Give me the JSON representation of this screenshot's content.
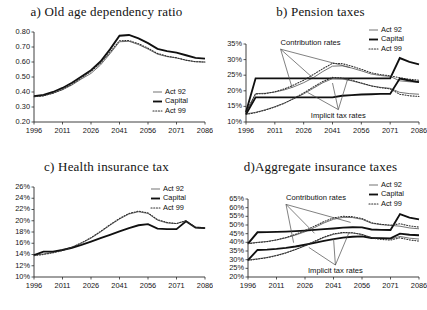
{
  "figure": {
    "legend_labels": [
      "Act 92",
      "Capital",
      "Act 99"
    ],
    "series_styles": [
      "thin-grey-line",
      "thick-black-line",
      "dotted-line"
    ],
    "colors": {
      "act92": "#6d6d6d",
      "capital": "#101010",
      "act99": "#2e2e2e",
      "axis": "#2b2b2b",
      "background": "#ffffff"
    },
    "annotations": {
      "contribution": "Contribution rates",
      "implicit": "Implicit tax rates"
    }
  },
  "chart_data": [
    {
      "panel": "a",
      "type": "line",
      "title": "a) Old age dependency ratio",
      "xlabel": "",
      "ylabel": "",
      "x": [
        1996,
        2001,
        2006,
        2011,
        2016,
        2021,
        2026,
        2031,
        2036,
        2041,
        2046,
        2051,
        2056,
        2061,
        2066,
        2071,
        2076,
        2081,
        2086
      ],
      "xlim": [
        1996,
        2086
      ],
      "ylim": [
        0.2,
        0.8
      ],
      "xticks": [
        1996,
        2011,
        2026,
        2041,
        2056,
        2071,
        2086
      ],
      "yticks": [
        0.2,
        0.3,
        0.4,
        0.5,
        0.6,
        0.7,
        0.8
      ],
      "ytick_labels": [
        "0.20",
        "0.30",
        "0.40",
        "0.50",
        "0.60",
        "0.70",
        "0.80"
      ],
      "grid": false,
      "legend_position": "inside-bottom-right",
      "series": [
        {
          "name": "Act 92",
          "values": [
            0.37,
            0.375,
            0.392,
            0.415,
            0.447,
            0.487,
            0.524,
            0.58,
            0.655,
            0.735,
            0.738,
            0.716,
            0.686,
            0.652,
            0.636,
            0.627,
            0.612,
            0.602,
            0.6
          ]
        },
        {
          "name": "Capital",
          "values": [
            0.372,
            0.381,
            0.4,
            0.427,
            0.462,
            0.503,
            0.545,
            0.603,
            0.684,
            0.775,
            0.78,
            0.757,
            0.726,
            0.688,
            0.672,
            0.662,
            0.645,
            0.628,
            0.622
          ]
        },
        {
          "name": "Act 99",
          "values": [
            0.368,
            0.374,
            0.392,
            0.418,
            0.452,
            0.494,
            0.537,
            0.592,
            0.665,
            0.742,
            0.743,
            0.722,
            0.692,
            0.657,
            0.639,
            0.628,
            0.612,
            0.602,
            0.6
          ]
        }
      ]
    },
    {
      "panel": "b",
      "type": "line",
      "title": "b) Pension taxes",
      "xlabel": "",
      "ylabel": "",
      "x": [
        1996,
        2001,
        2006,
        2011,
        2016,
        2021,
        2026,
        2031,
        2036,
        2041,
        2046,
        2051,
        2056,
        2061,
        2066,
        2071,
        2076,
        2081,
        2086
      ],
      "xlim": [
        1996,
        2086
      ],
      "ylim": [
        10,
        35
      ],
      "xticks": [
        1996,
        2011,
        2026,
        2041,
        2056,
        2071,
        2086
      ],
      "yticks": [
        10,
        15,
        20,
        25,
        30,
        35
      ],
      "ytick_labels": [
        "10%",
        "15%",
        "20%",
        "25%",
        "30%",
        "35%"
      ],
      "grid": false,
      "legend_position": "top-right-outside",
      "annotations": [
        {
          "text": "Contribution rates",
          "x": 2014,
          "y": 34.6
        },
        {
          "text": "Implicit tax rates",
          "x": 2044,
          "y": 11.4
        }
      ],
      "groups": [
        {
          "group": "Contribution rates",
          "series": [
            {
              "name": "Act 92",
              "values": [
                13.3,
                19.1,
                19.2,
                19.6,
                20.3,
                21.3,
                22.6,
                24.2,
                26.2,
                27.9,
                28.0,
                27.3,
                26.4,
                25.4,
                24.9,
                24.6,
                23.2,
                22.9,
                22.7
              ]
            },
            {
              "name": "Capital",
              "values": [
                13.2,
                24.0,
                24.0,
                24.0,
                24.0,
                24.0,
                24.0,
                24.0,
                24.0,
                24.0,
                24.0,
                24.0,
                24.0,
                24.0,
                24.0,
                24.0,
                30.5,
                29.3,
                28.5
              ]
            },
            {
              "name": "Act 99",
              "values": [
                13.1,
                19.0,
                19.1,
                19.7,
                20.6,
                21.9,
                23.4,
                25.2,
                27.1,
                28.8,
                28.7,
                27.9,
                26.9,
                25.8,
                25.2,
                24.8,
                24.2,
                23.7,
                23.4
              ]
            }
          ]
        },
        {
          "group": "Implicit tax rates",
          "series": [
            {
              "name": "Act 92",
              "values": [
                12.6,
                13.1,
                13.9,
                14.9,
                16.1,
                17.5,
                19.0,
                20.8,
                22.6,
                23.9,
                23.8,
                23.2,
                22.4,
                21.6,
                21.1,
                20.8,
                19.5,
                19.1,
                18.9
              ]
            },
            {
              "name": "Capital",
              "values": [
                12.5,
                17.9,
                17.9,
                17.9,
                17.9,
                17.9,
                17.9,
                17.9,
                17.9,
                17.9,
                18.4,
                18.6,
                18.8,
                18.9,
                19.0,
                19.0,
                23.9,
                23.3,
                22.8
              ]
            },
            {
              "name": "Act 99",
              "values": [
                12.4,
                13.0,
                13.8,
                14.8,
                16.0,
                17.6,
                19.3,
                21.2,
                23.0,
                24.3,
                24.1,
                23.4,
                22.5,
                21.6,
                21.0,
                20.6,
                18.9,
                18.4,
                18.2
              ]
            }
          ]
        }
      ]
    },
    {
      "panel": "c",
      "type": "line",
      "title": "c) Health insurance tax",
      "xlabel": "",
      "ylabel": "",
      "x": [
        1996,
        2001,
        2006,
        2011,
        2016,
        2021,
        2026,
        2031,
        2036,
        2041,
        2046,
        2051,
        2056,
        2061,
        2066,
        2071,
        2076,
        2081,
        2086
      ],
      "xlim": [
        1996,
        2086
      ],
      "ylim": [
        10,
        26
      ],
      "xticks": [
        1996,
        2011,
        2026,
        2041,
        2056,
        2071,
        2086
      ],
      "yticks": [
        10,
        12,
        14,
        16,
        18,
        20,
        22,
        24,
        26
      ],
      "ytick_labels": [
        "10%",
        "12%",
        "14%",
        "16%",
        "18%",
        "20%",
        "22%",
        "24%",
        "26%"
      ],
      "grid": false,
      "legend_position": "top-right-inside",
      "series": [
        {
          "name": "Act 92",
          "values": [
            13.9,
            14.1,
            14.4,
            14.8,
            15.3,
            16.0,
            16.9,
            18.0,
            19.2,
            20.3,
            21.2,
            21.6,
            21.3,
            20.1,
            19.6,
            19.5,
            20.0,
            18.8,
            18.7
          ]
        },
        {
          "name": "Capital",
          "values": [
            13.9,
            14.5,
            14.5,
            14.8,
            15.2,
            15.7,
            16.3,
            16.9,
            17.5,
            18.1,
            18.7,
            19.2,
            19.4,
            18.6,
            18.5,
            18.5,
            19.9,
            18.8,
            18.7
          ]
        },
        {
          "name": "Act 99",
          "values": [
            13.8,
            14.0,
            14.3,
            14.7,
            15.3,
            16.1,
            17.0,
            18.1,
            19.3,
            20.4,
            21.3,
            21.7,
            21.4,
            20.2,
            19.7,
            19.5,
            20.0,
            18.8,
            18.7
          ]
        }
      ]
    },
    {
      "panel": "d",
      "type": "line",
      "title": "d)Aggregate insurance taxes",
      "xlabel": "",
      "ylabel": "",
      "x": [
        1996,
        2001,
        2006,
        2011,
        2016,
        2021,
        2026,
        2031,
        2036,
        2041,
        2046,
        2051,
        2056,
        2061,
        2066,
        2071,
        2076,
        2081,
        2086
      ],
      "xlim": [
        1996,
        2086
      ],
      "ylim": [
        20,
        65
      ],
      "xticks": [
        1996,
        2011,
        2026,
        2041,
        2056,
        2071,
        2086
      ],
      "yticks": [
        20,
        25,
        30,
        35,
        40,
        45,
        50,
        55,
        60,
        65
      ],
      "ytick_labels": [
        "20%",
        "25%",
        "30%",
        "35%",
        "40%",
        "45%",
        "50%",
        "55%",
        "60%",
        "65%"
      ],
      "grid": false,
      "legend_position": "top-right-outside",
      "annotations": [
        {
          "text": "Contribution rates",
          "x": 2016,
          "y": 64.2
        },
        {
          "text": "Implicit tax rates",
          "x": 2042,
          "y": 22.3
        }
      ],
      "groups": [
        {
          "group": "Contribution rates",
          "series": [
            {
              "name": "Act 92",
              "values": [
                39.4,
                40.0,
                40.5,
                41.4,
                42.6,
                44.2,
                46.1,
                48.5,
                51.2,
                53.3,
                54.4,
                54.3,
                53.3,
                51.0,
                50.2,
                49.8,
                49.3,
                48.3,
                47.8
              ]
            },
            {
              "name": "Capital",
              "values": [
                39.3,
                45.8,
                45.9,
                46.0,
                46.2,
                46.5,
                46.8,
                47.2,
                47.6,
                48.0,
                48.5,
                48.7,
                48.6,
                47.4,
                47.2,
                47.1,
                56.3,
                54.3,
                53.2
              ]
            },
            {
              "name": "Act 99",
              "values": [
                39.2,
                39.9,
                40.4,
                41.4,
                42.8,
                44.6,
                46.8,
                49.3,
                52.0,
                54.1,
                55.0,
                54.8,
                53.7,
                51.3,
                50.4,
                49.9,
                50.7,
                49.5,
                48.8
              ]
            }
          ]
        },
        {
          "group": "Implicit tax rates",
          "series": [
            {
              "name": "Act 92",
              "values": [
                29.8,
                30.5,
                31.3,
                32.5,
                34.0,
                35.8,
                37.9,
                40.3,
                42.8,
                44.6,
                45.5,
                45.4,
                44.6,
                42.8,
                42.2,
                41.9,
                43.4,
                42.4,
                41.9
              ]
            },
            {
              "name": "Capital",
              "values": [
                29.7,
                35.6,
                35.8,
                36.2,
                36.8,
                37.6,
                38.6,
                39.7,
                40.8,
                41.8,
                42.7,
                43.2,
                43.4,
                42.5,
                42.4,
                42.3,
                45.0,
                44.4,
                44.1
              ]
            },
            {
              "name": "Act 99",
              "values": [
                29.6,
                30.3,
                31.1,
                32.3,
                33.9,
                35.9,
                38.1,
                40.6,
                43.1,
                44.9,
                45.7,
                45.5,
                44.5,
                42.5,
                41.7,
                41.3,
                42.6,
                41.4,
                40.7
              ]
            }
          ]
        }
      ]
    }
  ]
}
